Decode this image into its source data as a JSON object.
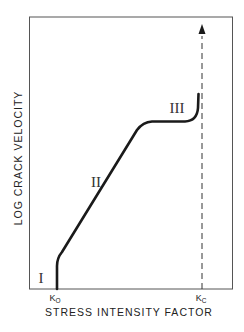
{
  "diagram": {
    "title": "",
    "x_axis_label": "STRESS INTENSITY FACTOR",
    "y_axis_label": "LOG CRACK VELOCITY",
    "ticks": [
      {
        "main": "K",
        "sub": "O",
        "meaning": "threshold stress intensity"
      },
      {
        "main": "K",
        "sub": "C",
        "meaning": "critical stress intensity"
      }
    ],
    "regions": [
      {
        "label": "I",
        "description": "near-threshold region"
      },
      {
        "label": "II",
        "description": "linear log-velocity region"
      },
      {
        "label": "III",
        "description": "plateau then rapid rise toward Kc"
      }
    ],
    "curve_description": "Crack velocity curve: vertical rise at K0, linear region II, plateau region III, then sharp upturn approaching Kc",
    "critical_line": {
      "style": "dashed",
      "arrow": "up"
    },
    "colors": {
      "line": "#1a1a1a",
      "frame": "#555555",
      "background": "#ffffff"
    }
  }
}
